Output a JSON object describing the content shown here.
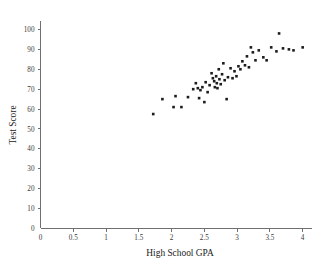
{
  "chart_data": {
    "type": "scatter",
    "title": "",
    "xlabel": "High School GPA",
    "ylabel": "Test Score",
    "xlim": [
      0,
      4.15
    ],
    "ylim": [
      0,
      104
    ],
    "grid": false,
    "legend": null,
    "xticks": [
      "0",
      "0.5",
      "1",
      "1.5",
      "2",
      "2.5",
      "3",
      "3.5",
      "4"
    ],
    "xtick_values": [
      0,
      0.5,
      1,
      1.5,
      2,
      2.5,
      3,
      3.5,
      4
    ],
    "yticks": [
      "0",
      "10",
      "20",
      "30",
      "40",
      "50",
      "60",
      "70",
      "80",
      "90",
      "100"
    ],
    "ytick_values": [
      0,
      10,
      20,
      30,
      40,
      50,
      60,
      70,
      80,
      90,
      100
    ],
    "marker": "filled-square",
    "marker_color": "#1c1c1c",
    "points": [
      {
        "x": 1.72,
        "y": 57.5
      },
      {
        "x": 1.86,
        "y": 65.0
      },
      {
        "x": 2.03,
        "y": 61.0
      },
      {
        "x": 2.06,
        "y": 66.5
      },
      {
        "x": 2.15,
        "y": 61.0
      },
      {
        "x": 2.25,
        "y": 66.0
      },
      {
        "x": 2.33,
        "y": 70.0
      },
      {
        "x": 2.37,
        "y": 73.0
      },
      {
        "x": 2.4,
        "y": 70.5
      },
      {
        "x": 2.42,
        "y": 65.5
      },
      {
        "x": 2.44,
        "y": 69.5
      },
      {
        "x": 2.47,
        "y": 71.0
      },
      {
        "x": 2.5,
        "y": 63.5
      },
      {
        "x": 2.52,
        "y": 73.5
      },
      {
        "x": 2.55,
        "y": 68.5
      },
      {
        "x": 2.58,
        "y": 72.0
      },
      {
        "x": 2.61,
        "y": 78.0
      },
      {
        "x": 2.63,
        "y": 75.5
      },
      {
        "x": 2.65,
        "y": 74.0
      },
      {
        "x": 2.66,
        "y": 71.0
      },
      {
        "x": 2.68,
        "y": 76.5
      },
      {
        "x": 2.69,
        "y": 73.0
      },
      {
        "x": 2.7,
        "y": 70.5
      },
      {
        "x": 2.72,
        "y": 80.0
      },
      {
        "x": 2.73,
        "y": 75.0
      },
      {
        "x": 2.75,
        "y": 72.5
      },
      {
        "x": 2.77,
        "y": 77.5
      },
      {
        "x": 2.79,
        "y": 83.0
      },
      {
        "x": 2.81,
        "y": 74.5
      },
      {
        "x": 2.84,
        "y": 65.0
      },
      {
        "x": 2.86,
        "y": 76.0
      },
      {
        "x": 2.9,
        "y": 80.5
      },
      {
        "x": 2.93,
        "y": 75.5
      },
      {
        "x": 2.96,
        "y": 79.0
      },
      {
        "x": 2.99,
        "y": 76.5
      },
      {
        "x": 3.02,
        "y": 81.5
      },
      {
        "x": 3.05,
        "y": 80.0
      },
      {
        "x": 3.08,
        "y": 84.0
      },
      {
        "x": 3.12,
        "y": 82.0
      },
      {
        "x": 3.15,
        "y": 86.5
      },
      {
        "x": 3.18,
        "y": 81.0
      },
      {
        "x": 3.21,
        "y": 91.0
      },
      {
        "x": 3.24,
        "y": 88.5
      },
      {
        "x": 3.28,
        "y": 84.5
      },
      {
        "x": 3.33,
        "y": 89.5
      },
      {
        "x": 3.4,
        "y": 86.0
      },
      {
        "x": 3.45,
        "y": 84.5
      },
      {
        "x": 3.52,
        "y": 91.0
      },
      {
        "x": 3.6,
        "y": 89.0
      },
      {
        "x": 3.64,
        "y": 98.0
      },
      {
        "x": 3.7,
        "y": 90.5
      },
      {
        "x": 3.79,
        "y": 90.0
      },
      {
        "x": 3.86,
        "y": 89.5
      },
      {
        "x": 4.0,
        "y": 91.0
      }
    ]
  },
  "axes": {
    "x_title": "High School GPA",
    "y_title": "Test Score"
  }
}
